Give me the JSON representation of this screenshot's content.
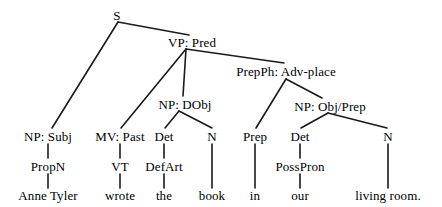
{
  "diagram": {
    "type": "syntax-tree",
    "sentence": "Anne Tyler wrote the book in our living room.",
    "line_color": "#1a1a1a",
    "text_color": "#000000",
    "background_color": "#ffffff",
    "nodes": [
      {
        "id": "s",
        "label": "S",
        "x": 117,
        "y": 15
      },
      {
        "id": "vp",
        "label": "VP: Pred",
        "x": 192,
        "y": 42
      },
      {
        "id": "prepph",
        "label": "PrepPh: Adv-place",
        "x": 286,
        "y": 71
      },
      {
        "id": "np_dobj",
        "label": "NP: DObj",
        "x": 185,
        "y": 104
      },
      {
        "id": "np_objprep",
        "label": "NP: Obj/Prep",
        "x": 330,
        "y": 106
      },
      {
        "id": "np_subj",
        "label": "NP: Subj",
        "x": 48,
        "y": 136
      },
      {
        "id": "mv_past",
        "label": "MV: Past",
        "x": 120,
        "y": 136
      },
      {
        "id": "det1",
        "label": "Det",
        "x": 164,
        "y": 136
      },
      {
        "id": "n1",
        "label": "N",
        "x": 212,
        "y": 136
      },
      {
        "id": "prep",
        "label": "Prep",
        "x": 255,
        "y": 136
      },
      {
        "id": "det2",
        "label": "Det",
        "x": 300,
        "y": 136
      },
      {
        "id": "n2",
        "label": "N",
        "x": 388,
        "y": 136
      },
      {
        "id": "propn",
        "label": "PropN",
        "x": 48,
        "y": 166
      },
      {
        "id": "vt",
        "label": "VT",
        "x": 120,
        "y": 166
      },
      {
        "id": "defart",
        "label": "DefArt",
        "x": 164,
        "y": 166
      },
      {
        "id": "posspron",
        "label": "PossPron",
        "x": 300,
        "y": 166
      },
      {
        "id": "w_anne",
        "label": "Anne Tyler",
        "x": 48,
        "y": 195
      },
      {
        "id": "w_wrote",
        "label": "wrote",
        "x": 120,
        "y": 195
      },
      {
        "id": "w_the",
        "label": "the",
        "x": 164,
        "y": 195
      },
      {
        "id": "w_book",
        "label": "book",
        "x": 212,
        "y": 195
      },
      {
        "id": "w_in",
        "label": "in",
        "x": 255,
        "y": 195
      },
      {
        "id": "w_our",
        "label": "our",
        "x": 300,
        "y": 195
      },
      {
        "id": "w_living",
        "label": "living room.",
        "x": 388,
        "y": 195
      }
    ],
    "edges": [
      {
        "from": "s",
        "to": "np_subj",
        "x1": 118,
        "y1": 22,
        "x2": 52,
        "y2": 128
      },
      {
        "from": "s",
        "to": "vp",
        "x1": 118,
        "y1": 22,
        "x2": 189,
        "y2": 35
      },
      {
        "from": "vp",
        "to": "mv_past",
        "x1": 186,
        "y1": 49,
        "x2": 121,
        "y2": 128
      },
      {
        "from": "vp",
        "to": "np_dobj",
        "x1": 186,
        "y1": 49,
        "x2": 183,
        "y2": 96
      },
      {
        "from": "vp",
        "to": "prepph",
        "x1": 186,
        "y1": 49,
        "x2": 284,
        "y2": 63
      },
      {
        "from": "np_dobj",
        "to": "det1",
        "x1": 179,
        "y1": 111,
        "x2": 165,
        "y2": 128
      },
      {
        "from": "np_dobj",
        "to": "n1",
        "x1": 179,
        "y1": 111,
        "x2": 212,
        "y2": 128
      },
      {
        "from": "prepph",
        "to": "prep",
        "x1": 286,
        "y1": 79,
        "x2": 256,
        "y2": 128
      },
      {
        "from": "prepph",
        "to": "np_objprep",
        "x1": 286,
        "y1": 79,
        "x2": 322,
        "y2": 98
      },
      {
        "from": "np_objprep",
        "to": "det2",
        "x1": 328,
        "y1": 113,
        "x2": 301,
        "y2": 128
      },
      {
        "from": "np_objprep",
        "to": "n2",
        "x1": 328,
        "y1": 113,
        "x2": 387,
        "y2": 128
      },
      {
        "from": "np_subj",
        "to": "propn",
        "x1": 48,
        "y1": 144,
        "x2": 48,
        "y2": 158
      },
      {
        "from": "propn",
        "to": "w_anne",
        "x1": 48,
        "y1": 174,
        "x2": 48,
        "y2": 188
      },
      {
        "from": "mv_past",
        "to": "vt",
        "x1": 120,
        "y1": 144,
        "x2": 120,
        "y2": 158
      },
      {
        "from": "vt",
        "to": "w_wrote",
        "x1": 120,
        "y1": 174,
        "x2": 120,
        "y2": 188
      },
      {
        "from": "det1",
        "to": "defart",
        "x1": 164,
        "y1": 144,
        "x2": 164,
        "y2": 158
      },
      {
        "from": "defart",
        "to": "w_the",
        "x1": 164,
        "y1": 174,
        "x2": 164,
        "y2": 188
      },
      {
        "from": "n1",
        "to": "w_book",
        "x1": 212,
        "y1": 144,
        "x2": 212,
        "y2": 188
      },
      {
        "from": "prep",
        "to": "w_in",
        "x1": 255,
        "y1": 144,
        "x2": 255,
        "y2": 188
      },
      {
        "from": "det2",
        "to": "posspron",
        "x1": 300,
        "y1": 144,
        "x2": 300,
        "y2": 158
      },
      {
        "from": "posspron",
        "to": "w_our",
        "x1": 300,
        "y1": 174,
        "x2": 300,
        "y2": 188
      },
      {
        "from": "n2",
        "to": "w_living",
        "x1": 388,
        "y1": 144,
        "x2": 388,
        "y2": 188
      }
    ]
  }
}
